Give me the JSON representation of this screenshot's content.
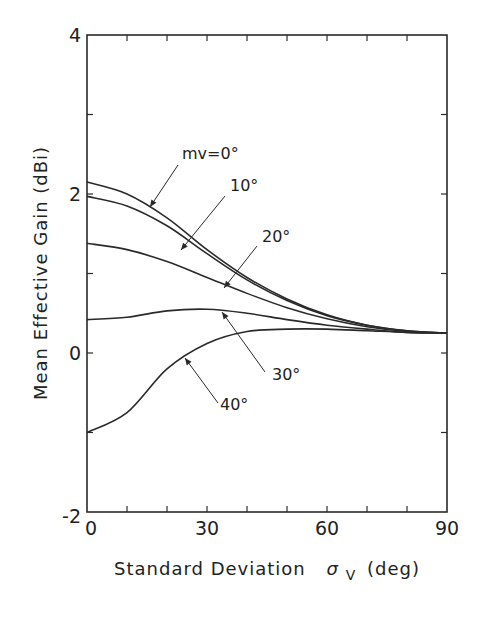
{
  "chart_data": {
    "type": "line",
    "title": "",
    "xlabel": "Standard Deviation",
    "xlabel_symbol": "σ",
    "xlabel_subscript": "V",
    "xlabel_unit": "(deg)",
    "ylabel": "Mean Effective Gain (dBi)",
    "xlim": [
      0,
      90
    ],
    "ylim": [
      -2,
      4
    ],
    "x_ticks": [
      0,
      30,
      60,
      90
    ],
    "x_tick_labels": [
      "0",
      "30",
      "60",
      "90"
    ],
    "x_minor_step": 10,
    "y_ticks": [
      -2,
      0,
      2,
      4
    ],
    "y_tick_labels": [
      "-2",
      "0",
      "2",
      "4"
    ],
    "y_minor_step": 1,
    "grid": false,
    "legend": "inline annotations with arrows",
    "x": [
      0,
      10,
      20,
      30,
      40,
      50,
      60,
      70,
      80,
      90
    ],
    "series": [
      {
        "name": "mv=0°",
        "label": "mv=0°",
        "values": [
          2.15,
          2.0,
          1.7,
          1.3,
          0.95,
          0.68,
          0.48,
          0.35,
          0.28,
          0.25
        ]
      },
      {
        "name": "10°",
        "label": "10°",
        "values": [
          1.97,
          1.85,
          1.6,
          1.25,
          0.92,
          0.66,
          0.47,
          0.35,
          0.28,
          0.25
        ]
      },
      {
        "name": "20°",
        "label": "20°",
        "values": [
          1.38,
          1.3,
          1.15,
          0.95,
          0.75,
          0.57,
          0.43,
          0.33,
          0.27,
          0.25
        ]
      },
      {
        "name": "30°",
        "label": "30°",
        "values": [
          0.42,
          0.45,
          0.53,
          0.55,
          0.5,
          0.42,
          0.35,
          0.3,
          0.26,
          0.25
        ]
      },
      {
        "name": "40°",
        "label": "40°",
        "values": [
          -1.0,
          -0.75,
          -0.2,
          0.12,
          0.27,
          0.3,
          0.3,
          0.28,
          0.26,
          0.25
        ]
      }
    ]
  }
}
